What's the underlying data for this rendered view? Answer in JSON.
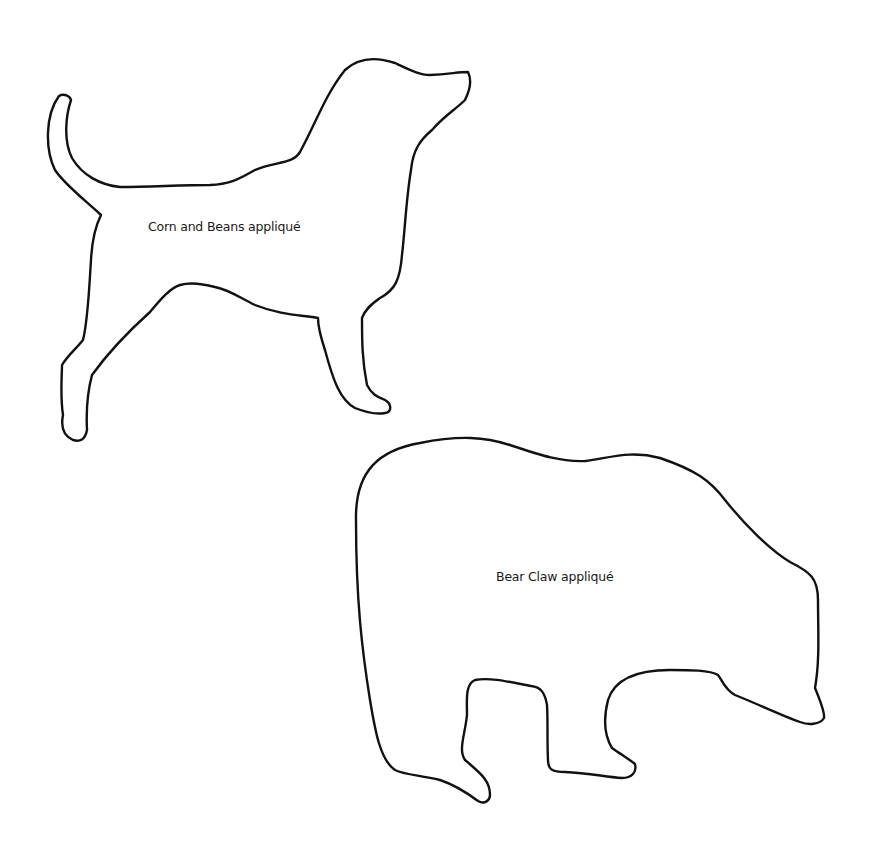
{
  "page": {
    "background": "#ffffff",
    "stroke_color": "#111111"
  },
  "shapes": [
    {
      "name": "dog",
      "label": "Corn and Beans appliqué"
    },
    {
      "name": "bear",
      "label": "Bear Claw appliqué"
    }
  ]
}
